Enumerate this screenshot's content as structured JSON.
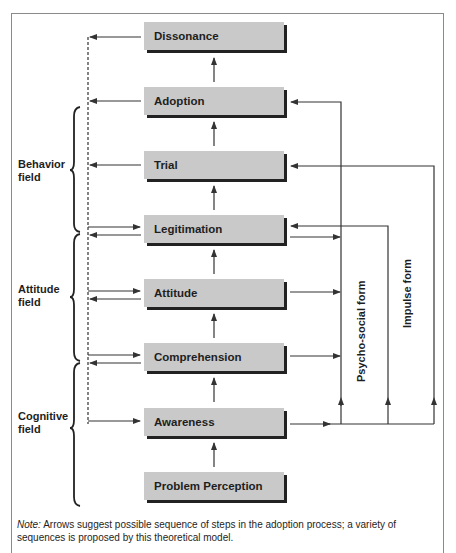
{
  "diagram": {
    "boxes": [
      {
        "id": "dissonance",
        "label": "Dissonance"
      },
      {
        "id": "adoption",
        "label": "Adoption"
      },
      {
        "id": "trial",
        "label": "Trial"
      },
      {
        "id": "legitimation",
        "label": "Legitimation"
      },
      {
        "id": "attitude",
        "label": "Attitude"
      },
      {
        "id": "comprehension",
        "label": "Comprehension"
      },
      {
        "id": "awareness",
        "label": "Awareness"
      },
      {
        "id": "problem_perception",
        "label": "Problem Perception"
      }
    ],
    "fields": [
      {
        "line1": "Behavior",
        "line2": "field"
      },
      {
        "line1": "Attitude",
        "line2": "field"
      },
      {
        "line1": "Cognitive",
        "line2": "field"
      }
    ],
    "vertical_labels": {
      "psycho_social": "Psycho-social form",
      "impulse": "Impulse form"
    },
    "note": {
      "prefix": "Note:",
      "text": " Arrows suggest possible sequence of steps in the adoption process; a variety of sequences is proposed by this theoretical model."
    },
    "colors": {
      "box_fill": "#c9c9c9",
      "box_shadow": "#222222",
      "line": "#333333",
      "frame": "#8a8a8a"
    }
  }
}
